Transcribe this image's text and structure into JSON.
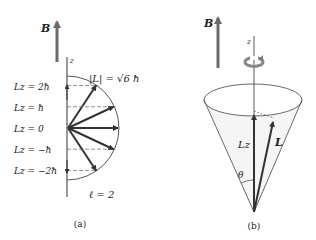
{
  "figure": {
    "panel_a": {
      "caption": "(a)",
      "field_label": "B",
      "axis_label": "z",
      "magnitude_label": "|L| = √6 ħ",
      "quantum_number_label": "ℓ = 2",
      "lz_levels": [
        {
          "label": "Lz = 2ħ",
          "m": 2
        },
        {
          "label": "Lz = ħ",
          "m": 1
        },
        {
          "label": "Lz = 0",
          "m": 0
        },
        {
          "label": "Lz = −ħ",
          "m": -1
        },
        {
          "label": "Lz = −2ħ",
          "m": -2
        }
      ],
      "l_value": 2
    },
    "panel_b": {
      "caption": "(b)",
      "field_label": "B",
      "axis_label": "z",
      "lz_label": "Lz",
      "l_label": "L",
      "angle_label": "θ"
    },
    "colors": {
      "arrow_dark": "#333333",
      "field_arrow": "#6b6b6b",
      "line": "#333333",
      "dash": "#777777",
      "cone_fill": "#f3f3f3"
    }
  }
}
